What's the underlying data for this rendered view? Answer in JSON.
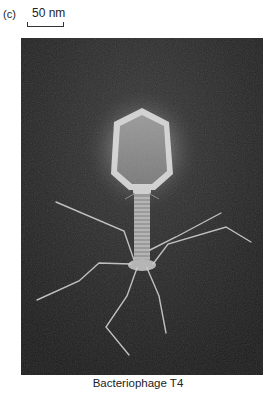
{
  "figure": {
    "panel_label": "(c)",
    "scale_bar_label": "50 nm",
    "caption": "Bacteriophage T4",
    "image_subject": "electron micrograph of bacteriophage T4",
    "colors": {
      "background": "#262626",
      "glow": "#ffffff",
      "structure": "#d8d8d8"
    }
  }
}
